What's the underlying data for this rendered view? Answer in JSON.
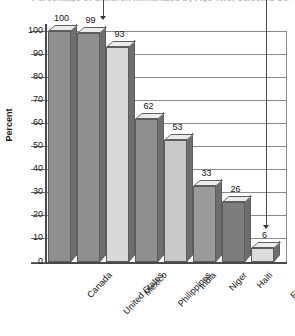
{
  "chart_data": {
    "type": "bar",
    "title": "Percentage of Children Immunized by Age Two, Selected Countries",
    "xlabel": "",
    "ylabel": "Percent",
    "ylim": [
      0,
      100
    ],
    "ytick_step": 10,
    "yticks": [
      "100",
      "90",
      "80",
      "70",
      "60",
      "50",
      "40",
      "30",
      "20",
      "10",
      "0"
    ],
    "grid": true,
    "legend": "none",
    "categories": [
      "Canada",
      "United States",
      "Mexico",
      "Philippines",
      "India",
      "Niger",
      "Haiti",
      "Ethiopia"
    ],
    "values": [
      100,
      99,
      93,
      62,
      53,
      33,
      26,
      6
    ],
    "value_labels": [
      "100",
      "99",
      "93",
      "62",
      "53",
      "33",
      "26",
      "6"
    ],
    "bar_colors": [
      "#8f8f8f",
      "#8f8f8f",
      "#d9d9d9",
      "#8f8f8f",
      "#c9c9c9",
      "#9a9a9a",
      "#7d7d7d",
      "#dcdcdc"
    ],
    "annotations": [
      {
        "name": "arrow-to-united-states",
        "target": "United States",
        "value": "99"
      },
      {
        "name": "arrow-to-ethiopia",
        "target": "Ethiopia",
        "value": "6"
      }
    ]
  },
  "axes": {
    "y_axis_label": "Percent"
  }
}
